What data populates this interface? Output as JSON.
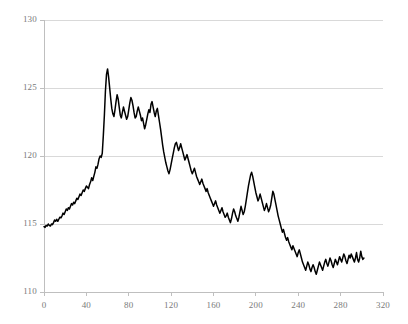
{
  "chart_data": {
    "type": "line",
    "title": "",
    "subtitle": "",
    "xlabel": "",
    "ylabel": "",
    "xlim": [
      0,
      320
    ],
    "ylim": [
      110,
      130
    ],
    "xticks": [
      0,
      40,
      80,
      120,
      160,
      200,
      240,
      280,
      320
    ],
    "yticks": [
      110,
      115,
      120,
      125,
      130
    ],
    "grid": true,
    "legend": null,
    "legend_position": "none",
    "line_color": "#000000",
    "grid_color": "#d9d9d9",
    "axis_color": "#bfbfbf",
    "tick_label_color": "#7a7a7a",
    "background_color": "#ffffff",
    "series": [
      {
        "name": "series-1",
        "x": [
          0,
          1,
          2,
          3,
          4,
          5,
          6,
          7,
          8,
          9,
          10,
          11,
          12,
          13,
          14,
          15,
          16,
          17,
          18,
          19,
          20,
          21,
          22,
          23,
          24,
          25,
          26,
          27,
          28,
          29,
          30,
          31,
          32,
          33,
          34,
          35,
          36,
          37,
          38,
          39,
          40,
          41,
          42,
          43,
          44,
          45,
          46,
          47,
          48,
          49,
          50,
          51,
          52,
          53,
          54,
          55,
          56,
          57,
          58,
          59,
          60,
          61,
          62,
          63,
          64,
          65,
          66,
          67,
          68,
          69,
          70,
          71,
          72,
          73,
          74,
          75,
          76,
          77,
          78,
          79,
          80,
          81,
          82,
          83,
          84,
          85,
          86,
          87,
          88,
          89,
          90,
          91,
          92,
          93,
          94,
          95,
          96,
          97,
          98,
          99,
          100,
          101,
          102,
          103,
          104,
          105,
          106,
          107,
          108,
          109,
          110,
          111,
          112,
          113,
          114,
          115,
          116,
          117,
          118,
          119,
          120,
          121,
          122,
          123,
          124,
          125,
          126,
          127,
          128,
          129,
          130,
          131,
          132,
          133,
          134,
          135,
          136,
          137,
          138,
          139,
          140,
          141,
          142,
          143,
          144,
          145,
          146,
          147,
          148,
          149,
          150,
          151,
          152,
          153,
          154,
          155,
          156,
          157,
          158,
          159,
          160,
          161,
          162,
          163,
          164,
          165,
          166,
          167,
          168,
          169,
          170,
          171,
          172,
          173,
          174,
          175,
          176,
          177,
          178,
          179,
          180,
          181,
          182,
          183,
          184,
          185,
          186,
          187,
          188,
          189,
          190,
          191,
          192,
          193,
          194,
          195,
          196,
          197,
          198,
          199,
          200,
          201,
          202,
          203,
          204,
          205,
          206,
          207,
          208,
          209,
          210,
          211,
          212,
          213,
          214,
          215,
          216,
          217,
          218,
          219,
          220,
          221,
          222,
          223,
          224,
          225,
          226,
          227,
          228,
          229,
          230,
          231,
          232,
          233,
          234,
          235,
          236,
          237,
          238,
          239,
          240,
          241,
          242,
          243,
          244,
          245,
          246,
          247,
          248,
          249,
          250,
          251,
          252,
          253,
          254,
          255,
          256,
          257,
          258,
          259,
          260,
          261,
          262,
          263,
          264,
          265,
          266,
          267,
          268,
          269,
          270,
          271,
          272,
          273,
          274,
          275,
          276,
          277,
          278,
          279,
          280,
          281,
          282,
          283,
          284,
          285,
          286,
          287,
          288,
          289,
          290,
          291,
          292,
          293,
          294,
          295,
          296,
          297,
          298,
          299,
          300,
          301,
          302
        ],
        "y": [
          114.8,
          114.75,
          114.9,
          114.85,
          115.0,
          114.9,
          114.85,
          115.0,
          114.95,
          115.1,
          115.3,
          115.2,
          115.35,
          115.2,
          115.35,
          115.5,
          115.45,
          115.6,
          115.8,
          115.7,
          115.9,
          116.1,
          116.0,
          116.2,
          116.1,
          116.3,
          116.5,
          116.4,
          116.6,
          116.5,
          116.7,
          116.9,
          116.8,
          117.0,
          117.2,
          117.1,
          117.3,
          117.5,
          117.4,
          117.6,
          117.8,
          117.7,
          117.6,
          117.9,
          118.1,
          118.4,
          118.2,
          118.5,
          118.8,
          119.2,
          119.1,
          119.4,
          119.8,
          120.0,
          119.9,
          120.2,
          121.5,
          123.0,
          124.8,
          126.0,
          126.4,
          125.8,
          125.0,
          124.2,
          123.5,
          123.1,
          122.9,
          123.4,
          124.0,
          124.5,
          124.2,
          123.6,
          123.0,
          122.8,
          123.2,
          123.6,
          123.3,
          123.0,
          122.7,
          122.9,
          123.4,
          123.9,
          124.3,
          124.1,
          123.7,
          123.2,
          122.8,
          122.9,
          123.3,
          123.6,
          123.3,
          123.0,
          122.6,
          122.8,
          122.4,
          122.0,
          122.3,
          122.7,
          123.1,
          123.4,
          123.2,
          123.8,
          124.0,
          123.6,
          123.2,
          122.9,
          123.3,
          123.5,
          123.0,
          122.5,
          122.0,
          121.4,
          120.8,
          120.3,
          119.9,
          119.5,
          119.2,
          118.9,
          118.7,
          119.0,
          119.4,
          119.8,
          120.2,
          120.6,
          120.9,
          121.0,
          120.7,
          120.4,
          120.6,
          120.9,
          120.6,
          120.3,
          120.0,
          119.7,
          119.9,
          120.1,
          119.8,
          119.5,
          119.2,
          118.9,
          118.7,
          118.9,
          119.1,
          118.8,
          118.5,
          118.3,
          118.1,
          117.9,
          118.1,
          118.3,
          118.0,
          117.8,
          117.6,
          117.4,
          117.6,
          117.3,
          117.1,
          116.9,
          116.7,
          116.5,
          116.3,
          116.5,
          116.7,
          116.4,
          116.2,
          116.0,
          115.8,
          116.0,
          116.2,
          115.9,
          115.7,
          115.5,
          115.6,
          115.8,
          115.5,
          115.3,
          115.1,
          115.4,
          115.8,
          116.1,
          115.9,
          115.6,
          115.4,
          115.2,
          115.5,
          115.9,
          116.3,
          116.0,
          115.7,
          115.9,
          116.3,
          116.8,
          117.3,
          117.8,
          118.2,
          118.6,
          118.8,
          118.5,
          118.1,
          117.7,
          117.3,
          117.0,
          116.7,
          116.9,
          117.2,
          116.9,
          116.6,
          116.3,
          116.0,
          116.2,
          116.5,
          116.2,
          115.9,
          116.1,
          116.4,
          116.9,
          117.4,
          117.2,
          116.8,
          116.4,
          116.0,
          115.6,
          115.3,
          115.0,
          114.7,
          114.4,
          114.6,
          114.3,
          114.0,
          113.8,
          114.0,
          113.7,
          113.5,
          113.3,
          113.1,
          113.4,
          113.2,
          113.0,
          112.8,
          112.6,
          112.9,
          113.1,
          112.8,
          112.5,
          112.2,
          112.0,
          111.8,
          111.6,
          111.9,
          112.2,
          112.0,
          111.7,
          111.5,
          111.8,
          112.0,
          111.8,
          111.5,
          111.3,
          111.6,
          111.9,
          112.2,
          112.0,
          111.8,
          111.6,
          111.9,
          112.2,
          112.4,
          112.1,
          111.9,
          112.2,
          112.5,
          112.3,
          112.0,
          111.8,
          112.1,
          112.4,
          112.2,
          112.0,
          112.3,
          112.6,
          112.4,
          112.2,
          112.5,
          112.8,
          112.6,
          112.3,
          112.1,
          112.4,
          112.7,
          112.5,
          112.8,
          112.6,
          112.4,
          112.2,
          112.5,
          112.9,
          112.4,
          112.2,
          112.5,
          113.0,
          112.6,
          112.4,
          112.5
        ]
      }
    ]
  },
  "axes": {
    "y_tick_labels": [
      "130",
      "125",
      "120",
      "115",
      "110"
    ],
    "x_tick_labels": [
      "0",
      "40",
      "80",
      "120",
      "160",
      "200",
      "240",
      "280",
      "320"
    ]
  }
}
